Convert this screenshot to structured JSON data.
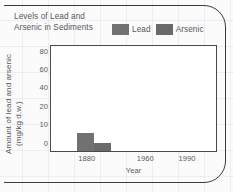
{
  "chart_data": {
    "type": "bar",
    "title": "Levels of Lead and Arsenic in Sediments",
    "title_line1": "Levels of Lead and",
    "title_line2": "Arsenic in Sediments",
    "xlabel": "Year",
    "ylabel": "Amount of lead and arsenic",
    "ylabel_line1": "Amount of lead and arsenic",
    "ylabel_line2": "(mg/kg d.w.)",
    "grid": false,
    "legend_position": "top-right",
    "categories": [
      "1880"
    ],
    "series": [
      {
        "name": "Lead",
        "values": [
          9
        ],
        "color": "#717171"
      },
      {
        "name": "Arsenic",
        "values": [
          3
        ],
        "color": "#6a6a6a"
      }
    ],
    "x_ticks": [
      {
        "label": "1880",
        "pos_pct": 22
      },
      {
        "label": "1960",
        "pos_pct": 57
      },
      {
        "label": "1990",
        "pos_pct": 82
      }
    ],
    "y_ticks": [
      {
        "label": "80",
        "value": 80,
        "pos_pct": 86
      },
      {
        "label": "60",
        "value": 60,
        "pos_pct": 69
      },
      {
        "label": "40",
        "value": 40,
        "pos_pct": 52
      },
      {
        "label": "20",
        "value": 20,
        "pos_pct": 35
      },
      {
        "label": "10",
        "value": 10,
        "pos_pct": 18
      },
      {
        "label": "0",
        "value": 0,
        "pos_pct": 0
      }
    ],
    "ylim": [
      0,
      93
    ],
    "bars": [
      {
        "series": "Lead",
        "x_pct": 15.5,
        "width_pct": 10.5,
        "height_pct": 17.5,
        "color": "#717171"
      },
      {
        "series": "Arsenic",
        "x_pct": 26.0,
        "width_pct": 10.5,
        "height_pct": 7.5,
        "color": "#6a6a6a"
      }
    ]
  },
  "legend": {
    "items": [
      {
        "label": "Lead",
        "color": "#717171"
      },
      {
        "label": "Arsenic",
        "color": "#6a6a6a"
      }
    ]
  },
  "colors": {
    "frame": "#3a3a3a",
    "plot_border": "#4a4a4a",
    "text": "#55555c",
    "tick_text": "#5a5a60",
    "plot_background": "#ffffff",
    "page_background": "#fbfbfb"
  }
}
